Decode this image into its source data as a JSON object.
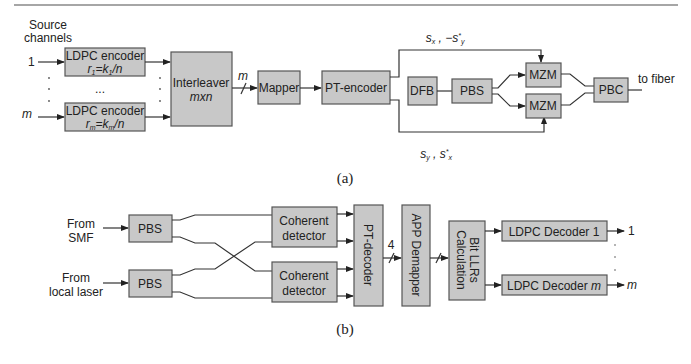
{
  "diagram_a": {
    "caption": "(a)",
    "source_label_line1": "Source",
    "source_label_line2": "channels",
    "input_first": "1",
    "input_last": "m",
    "ellipsis": "...",
    "encoder_top": {
      "label": "LDPC encoder",
      "rate": "r1=k1/n"
    },
    "encoder_bottom": {
      "label": "LDPC encoder",
      "rate": "rm=km/n"
    },
    "interleaver": {
      "label": "Interleaver",
      "size": "mxn"
    },
    "bus_label": "m",
    "mapper": "Mapper",
    "pt_encoder": "PT-encoder",
    "dfb": "DFB",
    "pbs": "PBS",
    "mzm_top": "MZM",
    "mzm_bottom": "MZM",
    "pbc": "PBC",
    "output": "to fiber",
    "signal_top": "sx , −s*y",
    "signal_bottom": "sy , s*x"
  },
  "diagram_b": {
    "caption": "(b)",
    "input_top_line1": "From",
    "input_top_line2": "SMF",
    "input_bottom_line1": "From",
    "input_bottom_line2": "local laser",
    "pbs_top": "PBS",
    "pbs_bottom": "PBS",
    "detector_top_line1": "Coherent",
    "detector_top_line2": "detector",
    "detector_bottom_line1": "Coherent",
    "detector_bottom_line2": "detector",
    "pt_decoder": "PT-decoder",
    "bus_label": "4",
    "app_demapper": "APP Demapper",
    "llr_line1": "Bit LLRs",
    "llr_line2": "Calculation",
    "decoder_top": "LDPC Decoder 1",
    "decoder_bottom": "LDPC Decoder m",
    "output_first": "1",
    "output_last": "m"
  }
}
